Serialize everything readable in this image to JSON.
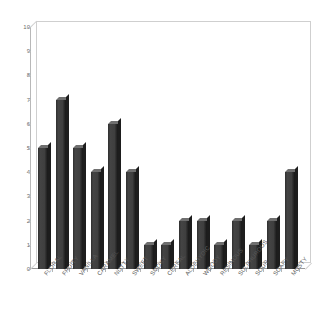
{
  "chart_data": {
    "type": "bar",
    "title": "",
    "subtitle": "",
    "xlabel": "",
    "ylabel": "",
    "ylim": [
      0,
      10
    ],
    "ytick_step": 1,
    "yticks": [
      "10",
      "9",
      "8",
      "7",
      "6",
      "5",
      "4",
      "3",
      "2",
      "1",
      "0"
    ],
    "grid": false,
    "legend": false,
    "legend_position": "none",
    "orientation": "vertical",
    "style": "3d-column",
    "bar_color": "#3b3b3b",
    "bar_top_color": "#6f6f6f",
    "bar_side_color": "#1d1d1d",
    "axis_color": "#b8b8b8",
    "tick_label_color": "#5a5a5a",
    "background": "#ffffff",
    "categories": [
      "FLORAL",
      "FRUITY",
      "VANILLA",
      "CARAMEL",
      "NUTTY",
      "SWEET",
      "SMOKY",
      "CEREAL",
      "ALDEHYDIC",
      "WOODY",
      "RESINOUS",
      "SULPHUROUS",
      "SOUR",
      "SOAPY",
      "MUSTY"
    ],
    "values": [
      5,
      7,
      5,
      4,
      6,
      4,
      1,
      1,
      2,
      2,
      1,
      2,
      1,
      2,
      4
    ]
  }
}
